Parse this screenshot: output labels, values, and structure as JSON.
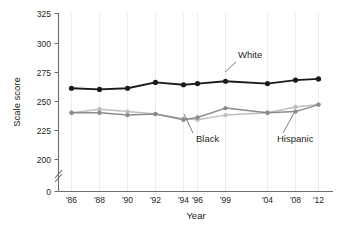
{
  "chart_data": {
    "type": "line",
    "title": "",
    "xlabel": "Year",
    "ylabel": "Scale score",
    "x": [
      1986,
      1988,
      1990,
      1992,
      1994,
      1996,
      1999,
      2004,
      2008,
      2012
    ],
    "tick_labels": [
      "'86",
      "'88",
      "'90",
      "'92",
      "'94",
      "'96",
      "'99",
      "'04",
      "'08",
      "'12"
    ],
    "ylim": [
      0,
      325
    ],
    "y_ticks": [
      0,
      200,
      225,
      250,
      275,
      300,
      325
    ],
    "y_tick_labels": [
      "0",
      "200",
      "225",
      "250",
      "275",
      "300",
      "325"
    ],
    "y_axis_break": true,
    "grid": "vertical",
    "legend_position": "inline-annotations",
    "series": [
      {
        "name": "White",
        "color": "#1a1a1a",
        "values": [
          261,
          260,
          261,
          266,
          264,
          265,
          267,
          265,
          268,
          269
        ]
      },
      {
        "name": "Black",
        "color": "#8c8c8c",
        "values": [
          240,
          240,
          238,
          239,
          234,
          236,
          244,
          240,
          241,
          247
        ]
      },
      {
        "name": "Hispanic",
        "color": "#bfbfbf",
        "values": [
          240,
          243,
          241,
          239,
          235,
          234,
          238,
          240,
          245,
          247
        ]
      }
    ],
    "annotations": [
      {
        "text": "White",
        "series": "White",
        "x_label": "'99"
      },
      {
        "text": "Black",
        "series": "Black",
        "x_label": "'96"
      },
      {
        "text": "Hispanic",
        "series": "Hispanic",
        "x_label": "'08"
      }
    ]
  },
  "axes": {
    "x_title": "Year",
    "y_title": "Scale score"
  },
  "labels": {
    "white": "White",
    "black": "Black",
    "hispanic": "Hispanic"
  },
  "ticks": {
    "y": [
      "325",
      "300",
      "275",
      "250",
      "225",
      "200",
      "0"
    ],
    "x": [
      "'86",
      "'88",
      "'90",
      "'92",
      "'94",
      "'96",
      "'99",
      "'04",
      "'08",
      "'12"
    ]
  },
  "colors": {
    "white_series": "#1a1a1a",
    "black_series": "#8c8c8c",
    "hispanic_series": "#bfbfbf",
    "axis": "#6d6e71",
    "grid": "#ededed",
    "text": "#231f20"
  }
}
